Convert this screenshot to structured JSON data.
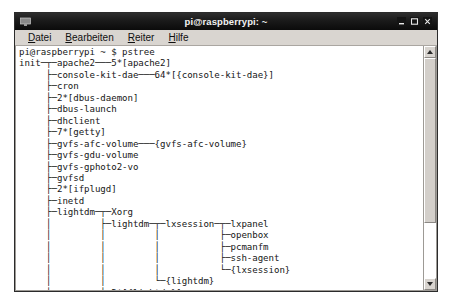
{
  "window": {
    "title": "pi@raspberrypi: ~",
    "icon": "terminal-icon",
    "controls": {
      "minimize": "minimize-icon",
      "maximize": "maximize-icon",
      "close": "close-icon"
    }
  },
  "menubar": {
    "items": [
      {
        "label": "Datei",
        "accel": "D"
      },
      {
        "label": "Bearbeiten",
        "accel": "B"
      },
      {
        "label": "Reiter",
        "accel": "R"
      },
      {
        "label": "Hilfe",
        "accel": "H"
      }
    ]
  },
  "terminal": {
    "prompt_line": "pi@raspberrypi ~ $ pstree",
    "command": "pstree",
    "user": "pi",
    "host": "raspberrypi",
    "cwd": "~",
    "output": [
      "init─┬─apache2───5*[apache2]",
      "     ├─console-kit-dae───64*[{console-kit-dae}]",
      "     ├─cron",
      "     ├─2*[dbus-daemon]",
      "     ├─dbus-launch",
      "     ├─dhclient",
      "     ├─7*[getty]",
      "     ├─gvfs-afc-volume───{gvfs-afc-volume}",
      "     ├─gvfs-gdu-volume",
      "     ├─gvfs-gphoto2-vo",
      "     ├─gvfsd",
      "     ├─2*[ifplugd]",
      "     ├─inetd",
      "     ├─lightdm─┬─Xorg",
      "     │         ├─lightdm─┬─lxsession─┬─lxpanel",
      "     │         │         │           ├─openbox",
      "     │         │         │           ├─pcmanfm",
      "     │         │         │           ├─ssh-agent",
      "     │         │         │           └─{lxsession}",
      "     │         │         └─{lightdm}",
      "     │         └─2*[{lightdm}]",
      "     ├─lxpolkit───{lxpolkit}",
      "     ├─lxterminal─┬─2*[bash]"
    ]
  },
  "scrollbar": {
    "up_arrow": "scroll-up-icon",
    "down_arrow": "scroll-down-icon",
    "thumb_position_percent": 0,
    "thumb_size_percent": 75
  },
  "colors": {
    "titlebar": "#1a1a1a",
    "titlebar_text": "#f2f2f2",
    "menubar": "#d9d5d0",
    "terminal_bg": "#ffffff",
    "terminal_fg": "#161616",
    "window_frame": "#2b2b2b"
  }
}
